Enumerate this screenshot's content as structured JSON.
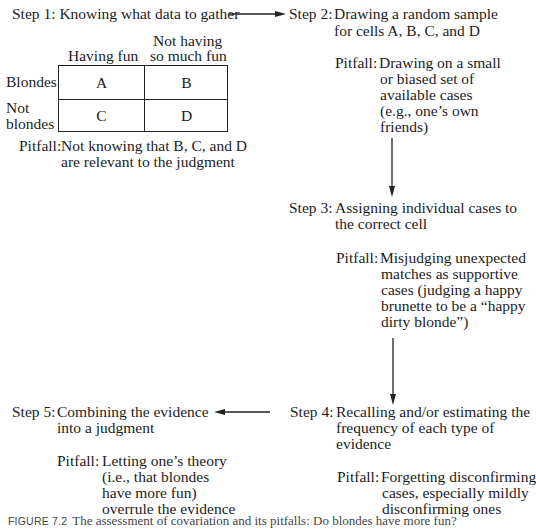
{
  "diagram": {
    "type": "flowchart",
    "title": "The assessment of covariation and its pitfalls",
    "steps": [
      {
        "label": "Step 1:",
        "text": "Knowing what data to gather",
        "pitfall_label": "Pitfall:",
        "pitfall_lines": [
          "Not knowing that B, C, and D",
          "are relevant to the judgment"
        ]
      },
      {
        "label": "Step 2:",
        "text_lines": [
          "Drawing a random sample",
          "for cells A, B, C, and D"
        ],
        "pitfall_label": "Pitfall:",
        "pitfall_lines": [
          "Drawing on a small",
          "or biased set of",
          "available cases",
          "(e.g., one’s own",
          "friends)"
        ]
      },
      {
        "label": "Step 3:",
        "text_lines": [
          "Assigning individual cases to",
          "the correct cell"
        ],
        "pitfall_label": "Pitfall:",
        "pitfall_lines": [
          "Misjudging unexpected",
          "matches as supportive",
          "cases (judging a happy",
          "brunette to be a “happy",
          "dirty blonde”)"
        ]
      },
      {
        "label": "Step 4:",
        "text_lines": [
          "Recalling and/or estimating the",
          "frequency of each type of",
          "evidence"
        ],
        "pitfall_label": "Pitfall:",
        "pitfall_lines": [
          "Forgetting disconfirming",
          "cases, especially mildly",
          "disconfirming ones"
        ]
      },
      {
        "label": "Step 5:",
        "text_lines": [
          "Combining the evidence",
          "into a judgment"
        ],
        "pitfall_label": "Pitfall:",
        "pitfall_lines": [
          "Letting one’s theory",
          "(i.e., that blondes",
          "have more fun)",
          "overrule the evidence"
        ]
      }
    ],
    "flow": [
      "Step 1 -> Step 2",
      "Step 2 -> Step 3",
      "Step 3 -> Step 4",
      "Step 4 -> Step 5"
    ]
  },
  "table": {
    "col_headers": [
      "Having fun",
      "Not having so much fun"
    ],
    "col_header_lines": [
      [
        "Having fun"
      ],
      [
        "Not having",
        "so much fun"
      ]
    ],
    "row_headers": [
      "Blondes",
      "Not blondes"
    ],
    "row_header_lines": [
      [
        "Blondes"
      ],
      [
        "Not",
        "blondes"
      ]
    ],
    "cells": [
      [
        "A",
        "B"
      ],
      [
        "C",
        "D"
      ]
    ]
  },
  "caption": {
    "figure_label": "FIGURE 7.2",
    "text": "The assessment of covariation and its pitfalls: Do blondes have more fun?"
  },
  "colors": {
    "text": "#1c1c1c",
    "lines": "#222222",
    "background": "#ffffff",
    "caption": "#444444"
  }
}
